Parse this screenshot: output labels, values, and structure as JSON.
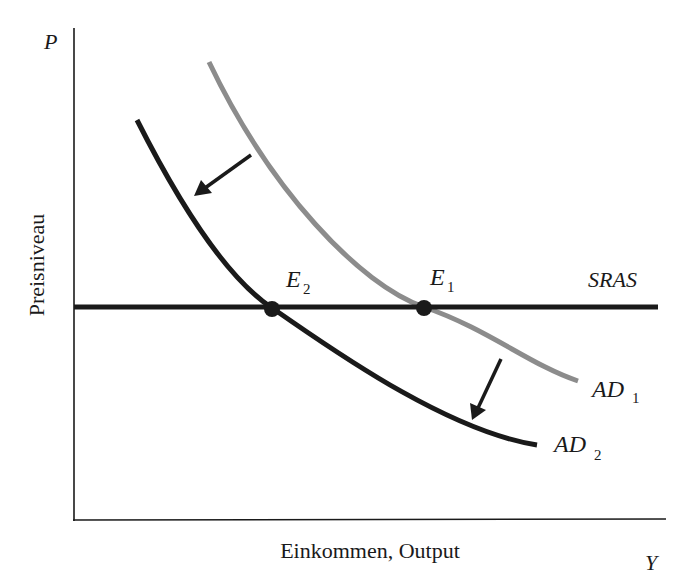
{
  "diagram": {
    "axes": {
      "y_axis_symbol": "P",
      "y_axis_label": "Preisniveau",
      "x_axis_symbol": "Y",
      "x_axis_label": "Einkommen, Output"
    },
    "curves": {
      "sras": {
        "label": "SRAS",
        "color": "#1a1a1a"
      },
      "ad1": {
        "label_main": "AD",
        "label_sub": "1",
        "color": "#8c8c8c"
      },
      "ad2": {
        "label_main": "AD",
        "label_sub": "2",
        "color": "#1a1a1a"
      }
    },
    "equilibria": {
      "e1": {
        "label_main": "E",
        "label_sub": "1"
      },
      "e2": {
        "label_main": "E",
        "label_sub": "2"
      }
    },
    "colors": {
      "background": "#ffffff",
      "axis": "#1a1a1a",
      "text": "#1a1a1a"
    }
  }
}
